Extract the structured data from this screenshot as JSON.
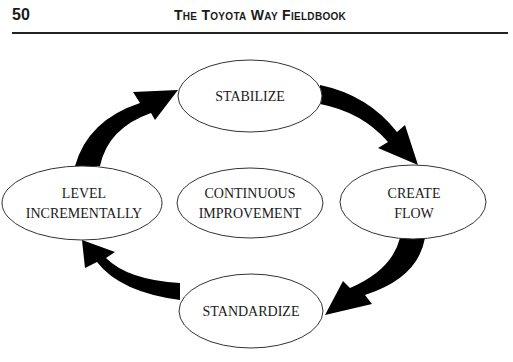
{
  "header": {
    "page_number": "50",
    "book_title": "The Toyota Way Fieldbook"
  },
  "diagram": {
    "center": {
      "line1": "CONTINUOUS",
      "line2": "IMPROVEMENT"
    },
    "nodes": [
      {
        "id": "stabilize",
        "line1": "STABILIZE",
        "line2": ""
      },
      {
        "id": "create-flow",
        "line1": "CREATE",
        "line2": "FLOW"
      },
      {
        "id": "standardize",
        "line1": "STANDARDIZE",
        "line2": ""
      },
      {
        "id": "level-incrementally",
        "line1": "LEVEL",
        "line2": "INCREMENTALLY"
      }
    ],
    "arrow_color": "#000000"
  }
}
